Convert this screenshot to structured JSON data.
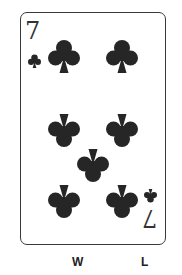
{
  "card": {
    "rank": "7",
    "suit": "clubs",
    "suit_icon": "club-icon",
    "pip_color": "#262626",
    "border_color": "#3a3a3a",
    "pip_count": 7
  },
  "labels": {
    "left": "W",
    "right": "L"
  }
}
